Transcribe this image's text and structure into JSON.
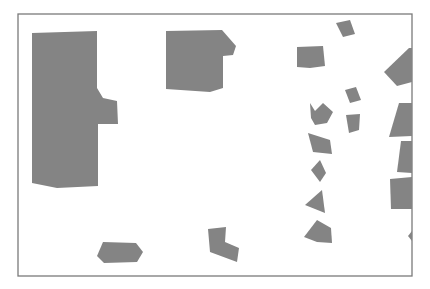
{
  "map": {
    "width": 430,
    "height": 289,
    "colors": {
      "background": "#ffffff",
      "frame": "#7a7a7a",
      "building_fill": "#848484"
    },
    "frame": {
      "x": 18,
      "y": 14,
      "width": 394,
      "height": 262
    },
    "buildings": [
      {
        "id": "large-left",
        "points": "32,33 97,31 97,88 103,98 117,101 118,124 98,124 98,186 57,188 32,183"
      },
      {
        "id": "upper-center",
        "points": "166,31 222,30 236,46 233,55 223,56 223,88 210,92 166,89"
      },
      {
        "id": "bottom-hex",
        "points": "103,242 136,243 143,252 137,262 104,263 97,256"
      },
      {
        "id": "bottom-L",
        "points": "208,229 226,227 225,242 239,248 237,262 210,252"
      },
      {
        "id": "top-small-a",
        "points": "336,23 350,20 355,34 343,37"
      },
      {
        "id": "mid-quad-a",
        "points": "297,47 323,46 325,66 310,68 297,67"
      },
      {
        "id": "small-b",
        "points": "345,90 356,87 361,100 350,103"
      },
      {
        "id": "small-c",
        "points": "346,115 360,114 359,130 349,133"
      },
      {
        "id": "star-shape",
        "points": "310,103 315,111 323,103 333,112 327,123 315,125 311,118"
      },
      {
        "id": "quad-d",
        "points": "308,133 330,140 332,154 313,152"
      },
      {
        "id": "diamond-e",
        "points": "311,170 320,160 326,173 320,182"
      },
      {
        "id": "tri-f",
        "points": "305,205 322,190 325,213"
      },
      {
        "id": "tri-g",
        "points": "304,237 317,220 331,228 332,243 317,242"
      },
      {
        "id": "right-a",
        "points": "384,72 409,48 412,48 412,82 397,86"
      },
      {
        "id": "right-b",
        "points": "399,103 412,103 412,136 389,137"
      },
      {
        "id": "right-c",
        "points": "401,141 412,141 412,173 397,172"
      },
      {
        "id": "right-d",
        "points": "390,179 412,177 412,209 391,209"
      },
      {
        "id": "right-e",
        "points": "408,236 412,231 412,241"
      }
    ]
  }
}
